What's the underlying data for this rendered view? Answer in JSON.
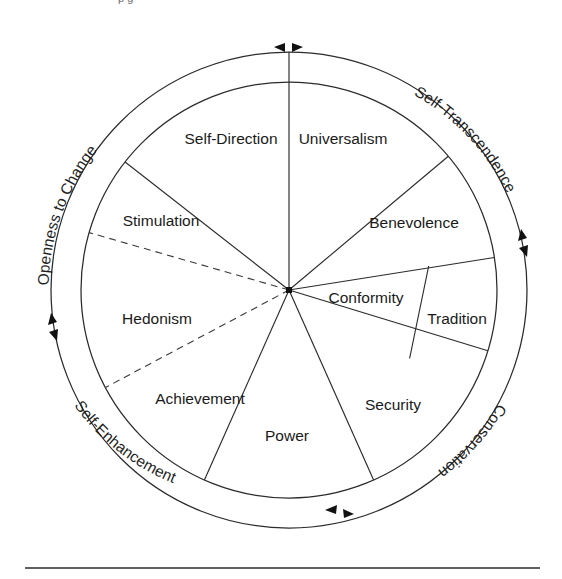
{
  "figure": {
    "caption_fragment": "p             g"
  },
  "diagram": {
    "center": {
      "x": 289,
      "y": 290
    },
    "outer_radius": 238,
    "inner_radius": 208,
    "value_labels": [
      {
        "id": "self-direction",
        "text": "Self-Direction",
        "x": 231,
        "y": 140
      },
      {
        "id": "universalism",
        "text": "Universalism",
        "x": 343,
        "y": 140
      },
      {
        "id": "benevolence",
        "text": "Benevolence",
        "x": 414,
        "y": 224
      },
      {
        "id": "conformity",
        "text": "Conformity",
        "x": 366,
        "y": 299
      },
      {
        "id": "tradition",
        "text": "Tradition",
        "x": 457,
        "y": 320
      },
      {
        "id": "security",
        "text": "Security",
        "x": 393,
        "y": 406
      },
      {
        "id": "power",
        "text": "Power",
        "x": 287,
        "y": 437
      },
      {
        "id": "achievement",
        "text": "Achievement",
        "x": 200,
        "y": 400
      },
      {
        "id": "hedonism",
        "text": "Hedonism",
        "x": 157,
        "y": 320
      },
      {
        "id": "stimulation",
        "text": "Stimulation",
        "x": 161,
        "y": 222
      }
    ],
    "dimension_labels": [
      {
        "id": "openness-to-change",
        "text": "Openness to Change"
      },
      {
        "id": "self-transcendence",
        "text": "Self-Transcendence"
      },
      {
        "id": "conservation",
        "text": "Conservation"
      },
      {
        "id": "self-enhancement",
        "text": "Self-Enhancement"
      }
    ],
    "arrow_markers": [
      {
        "id": "arrow-top",
        "angle_deg": -90
      },
      {
        "id": "arrow-right",
        "angle_deg": 0
      },
      {
        "id": "arrow-bottom",
        "angle_deg": 90
      },
      {
        "id": "arrow-left",
        "angle_deg": 180
      }
    ],
    "colors": {
      "stroke": "#2b2b2b",
      "text": "#1a1a1a",
      "background": "#ffffff",
      "caption": "#6e6e72"
    },
    "segments": [
      {
        "value": "self-direction",
        "start_deg": -97,
        "end_deg": -52
      },
      {
        "value": "universalism",
        "start_deg": -97,
        "end_deg": -42
      },
      {
        "value": "benevolence",
        "start_deg": -42,
        "end_deg": -8
      },
      {
        "value": "conformity",
        "start_deg": -8,
        "end_deg": 14
      },
      {
        "value": "tradition",
        "start_deg": 8,
        "end_deg": 30
      },
      {
        "value": "security",
        "start_deg": 14,
        "end_deg": 68
      },
      {
        "value": "power",
        "start_deg": 68,
        "end_deg": 112
      },
      {
        "value": "achievement",
        "start_deg": 112,
        "end_deg": 150
      },
      {
        "value": "hedonism",
        "start_deg": 150,
        "end_deg": 192
      },
      {
        "value": "stimulation",
        "start_deg": 192,
        "end_deg": 234
      }
    ]
  },
  "footer": {
    "rule_label": "horizontal-rule"
  }
}
